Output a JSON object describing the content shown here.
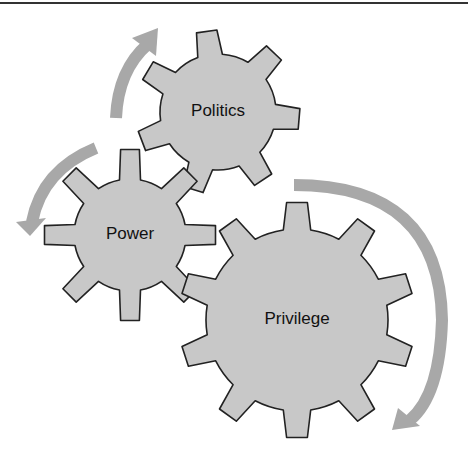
{
  "diagram": {
    "type": "interlocking-gears-cycle",
    "colors": {
      "gear_fill": "#c8c8c8",
      "gear_stroke": "#222222",
      "arrow": "#a8a8a8",
      "rule": "#333333",
      "text": "#111111"
    },
    "gears": [
      {
        "id": "politics",
        "label": "Politics",
        "cx": 218,
        "cy": 112,
        "teeth": 7,
        "outer_r": 82,
        "root_r": 58,
        "rotation": -8
      },
      {
        "id": "power",
        "label": "Power",
        "cx": 130,
        "cy": 235,
        "teeth": 8,
        "outer_r": 86,
        "root_r": 56,
        "rotation": 0
      },
      {
        "id": "privilege",
        "label": "Privilege",
        "cx": 297,
        "cy": 320,
        "teeth": 10,
        "outer_r": 118,
        "root_r": 91,
        "rotation": 0
      }
    ],
    "arrows": [
      {
        "id": "arrow-power-to-politics",
        "from": "Power",
        "to": "Politics",
        "path": "M 116 118 Q 118 70 148 44",
        "head": [
          [
            132,
            38
          ],
          [
            158,
            28
          ],
          [
            156,
            56
          ]
        ]
      },
      {
        "id": "arrow-politics-to-power",
        "from": "Politics",
        "to": "Power",
        "path": "M 96 148 Q 42 170 32 222",
        "head": [
          [
            16,
            222
          ],
          [
            46,
            218
          ],
          [
            30,
            236
          ]
        ]
      },
      {
        "id": "arrow-privilege-cycle",
        "from": "Politics",
        "to": "Privilege",
        "path": "M 294 185 Q 440 185 442 320 Q 440 395 410 420",
        "head": [
          [
            398,
            408
          ],
          [
            420,
            426
          ],
          [
            392,
            430
          ]
        ]
      }
    ]
  }
}
